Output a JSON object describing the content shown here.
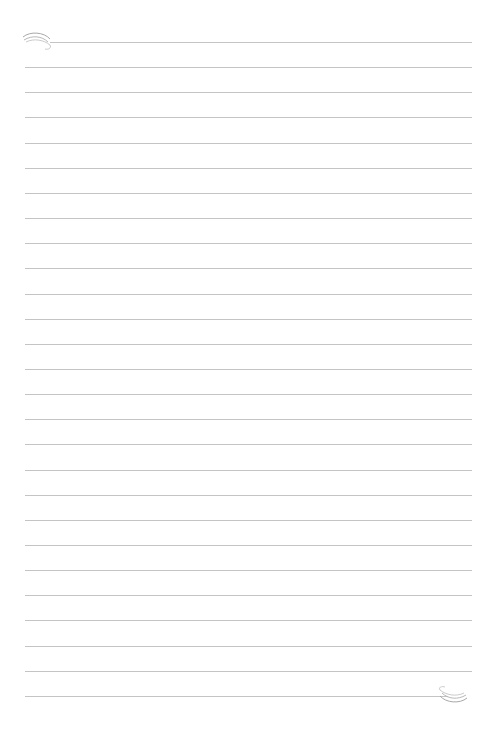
{
  "page": {
    "type": "lined-paper",
    "line_count": 27,
    "line_color": "#c4c4c4",
    "first_line_y": 42,
    "line_spacing": 25.15,
    "line_left": 25,
    "line_right": 472,
    "first_line_left": 50,
    "last_line_right": 448
  },
  "ornaments": {
    "top_left": "swirl-ornament",
    "bottom_right": "swirl-ornament"
  }
}
